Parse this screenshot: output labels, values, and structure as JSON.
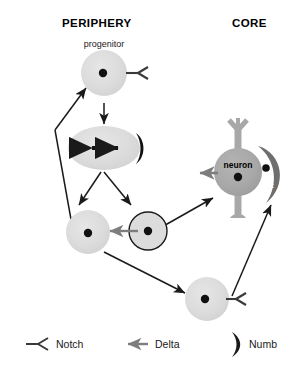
{
  "figure": {
    "headers": {
      "left": "PERIPHERY",
      "right": "CORE"
    },
    "cells": [
      {
        "id": "progenitor",
        "caption": "progenitor",
        "inner_label": "",
        "type": "round-cell",
        "fill": "#dcdcdc",
        "has_notch": true,
        "has_delta": false,
        "has_numb": false,
        "outlined": false
      },
      {
        "id": "dividing",
        "caption": "",
        "inner_label": "",
        "type": "dividing-cell",
        "fill": "#dcdcdc",
        "has_notch": false,
        "has_delta": false,
        "has_numb": true,
        "outlined": false
      },
      {
        "id": "daughter-left",
        "caption": "",
        "inner_label": "",
        "type": "round-cell",
        "fill": "#dcdcdc",
        "has_notch": false,
        "has_delta": false,
        "has_numb": false,
        "outlined": false
      },
      {
        "id": "daughter-right",
        "caption": "",
        "inner_label": "",
        "type": "round-cell-outlined",
        "fill": "#dcdcdc",
        "has_notch": false,
        "has_delta": true,
        "has_numb": false,
        "outlined": true
      },
      {
        "id": "neuron",
        "caption": "",
        "inner_label": "neuron",
        "type": "neuron-cell",
        "fill": "#a8a8a8",
        "has_notch": false,
        "has_delta": true,
        "has_numb": false,
        "outlined": false
      },
      {
        "id": "satellite",
        "caption": "",
        "inner_label": "sat",
        "type": "satellite-cell",
        "fill": "#6e6e6e",
        "has_notch": false,
        "has_delta": false,
        "has_numb": false,
        "outlined": false
      },
      {
        "id": "bottom-cell",
        "caption": "",
        "inner_label": "",
        "type": "round-cell",
        "fill": "#dcdcdc",
        "has_notch": true,
        "has_delta": false,
        "has_numb": false,
        "outlined": false
      }
    ],
    "legend": [
      {
        "id": "notch",
        "label": "Notch",
        "symbol": "notch-fork-icon",
        "color": "#3a3a3a"
      },
      {
        "id": "delta",
        "label": "Delta",
        "symbol": "delta-arrow-icon",
        "color": "#7d7d7d"
      },
      {
        "id": "numb",
        "label": "Numb",
        "symbol": "numb-crescent-icon",
        "color": "#1a1a1a"
      }
    ],
    "colors": {
      "cell_light": "#dcdcdc",
      "cell_medium": "#a8a8a8",
      "cell_dark": "#6e6e6e",
      "nucleus": "#111111",
      "arrow_black": "#1a1a1a",
      "arrow_delta": "#7d7d7d",
      "outline": "#1a1a1a",
      "background": "#ffffff"
    }
  }
}
